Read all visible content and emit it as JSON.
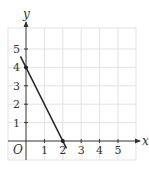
{
  "chart_data": {
    "type": "line",
    "title": "",
    "xlabel": "x",
    "ylabel": "y",
    "origin_label": "O",
    "xlim": [
      -0.3,
      5.8
    ],
    "ylim": [
      -1,
      6
    ],
    "x_ticks": [
      "1",
      "2",
      "3",
      "4",
      "5"
    ],
    "y_ticks": [
      "1",
      "2",
      "3",
      "4",
      "5"
    ],
    "grid": true,
    "series": [
      {
        "name": "line",
        "x": [
          -0.3,
          2.2
        ],
        "y": [
          4.6,
          -0.4
        ],
        "equation": "y = -2x + 4",
        "marked_points": [
          [
            0,
            4
          ],
          [
            2,
            0
          ]
        ]
      }
    ]
  },
  "colors": {
    "grid": "#e2e2e2",
    "axis": "#333333",
    "line": "#222222"
  }
}
